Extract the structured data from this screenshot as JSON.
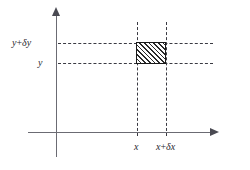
{
  "figure": {
    "title": "",
    "background_color": "#ffffff",
    "axis_color": "#6b6b73",
    "dash_color": "#3a3a42",
    "cell_border_color": "#1a1a1a",
    "hatch_color": "#2a2a2a"
  },
  "axes": {
    "x_axis_name": "x-axis",
    "y_axis_name": "y-axis",
    "x_arrow": "arrowhead-right",
    "y_arrow": "arrowhead-up"
  },
  "labels": {
    "y_upper": {
      "var": "y",
      "op": "+",
      "delta": "δy"
    },
    "y_lower": {
      "var": "y"
    },
    "x_left": {
      "var": "x"
    },
    "x_right": {
      "var": "x",
      "op": "+",
      "delta": "δx"
    }
  },
  "chart_data": {
    "type": "diagram",
    "title": "",
    "xlabel": "",
    "ylabel": "",
    "gridlines": "dashed construction lines only",
    "legend": "none",
    "elements": [
      {
        "name": "hatched-cell",
        "shape": "rectangle",
        "fill": "diagonal hatch 45deg",
        "x_from_label": "x",
        "x_to_label": "x + δx",
        "y_from_label": "y",
        "y_to_label": "y + δy"
      }
    ],
    "tick_labels": {
      "x": [
        "x",
        "x + δx"
      ],
      "y": [
        "y",
        "y + δy"
      ]
    }
  }
}
